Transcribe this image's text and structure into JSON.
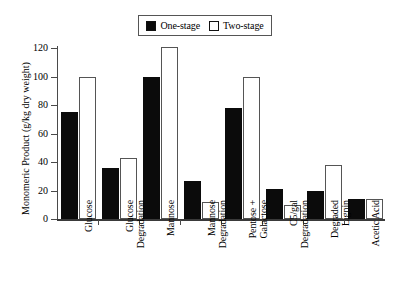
{
  "chart_data": {
    "type": "bar",
    "title": "",
    "xlabel": "",
    "ylabel": "Monomeric Product (g/kg dry weight)",
    "ylim": [
      0,
      120
    ],
    "yticks": [
      0,
      20,
      40,
      60,
      80,
      100,
      120
    ],
    "grid": false,
    "legend_position": "top-center",
    "categories": [
      "Glucose",
      "Glucose\nDegradation",
      "Mannose",
      "Mannose\nDegradation",
      "Pentose +\nGalactose",
      "C5/gal\nDegradation",
      "Degraded\nLignin",
      "Acetic Acid"
    ],
    "series": [
      {
        "name": "One-stage",
        "color": "#0b0b0b",
        "values": [
          75,
          36,
          100,
          27,
          78,
          21,
          20,
          14
        ]
      },
      {
        "name": "Two-stage",
        "color": "#ffffff",
        "values": [
          100,
          43,
          121,
          12,
          100,
          10,
          38,
          14
        ]
      }
    ]
  },
  "legend": {
    "items": [
      {
        "label": "One-stage",
        "swatch": "filled-square"
      },
      {
        "label": "Two-stage",
        "swatch": "hollow-square"
      }
    ]
  },
  "axes": {
    "y_title": "Monomeric Product (g/kg dry weight)",
    "y_tick_labels": [
      "0",
      "20",
      "40",
      "60",
      "80",
      "100",
      "120"
    ]
  }
}
